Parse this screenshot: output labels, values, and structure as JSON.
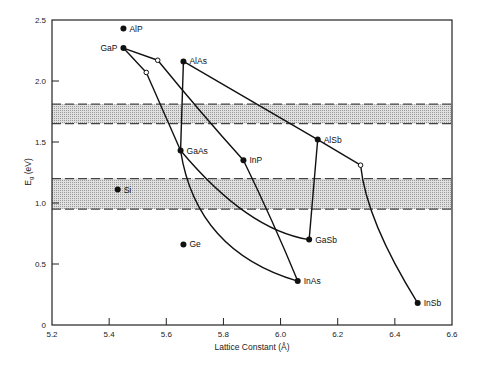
{
  "chart_data": {
    "type": "scatter",
    "title": "",
    "xlabel": "Lattice Constant (Å)",
    "ylabel": "Eg (eV)",
    "ylabel_main": "E",
    "ylabel_sub": "g",
    "ylabel_unit": " (eV)",
    "xlim": [
      5.2,
      6.6
    ],
    "ylim": [
      0,
      2.5
    ],
    "grid": false,
    "legend": null,
    "x_ticks": [
      {
        "value": 5.2,
        "label": "5.2"
      },
      {
        "value": 5.4,
        "label": "5.4"
      },
      {
        "value": 5.6,
        "label": "5.6"
      },
      {
        "value": 5.8,
        "label": "5.8"
      },
      {
        "value": 6.0,
        "label": "6.0"
      },
      {
        "value": 6.2,
        "label": "6.2"
      },
      {
        "value": 6.4,
        "label": "6.4"
      },
      {
        "value": 6.6,
        "label": "6.6"
      }
    ],
    "y_ticks": [
      {
        "value": 0,
        "label": "0"
      },
      {
        "value": 0.5,
        "label": "0.5"
      },
      {
        "value": 1.0,
        "label": "1.0"
      },
      {
        "value": 1.5,
        "label": "1.5"
      },
      {
        "value": 2.0,
        "label": "2.0"
      },
      {
        "value": 2.5,
        "label": "2.5"
      }
    ],
    "bands": [
      {
        "name": "upper-band",
        "y_low": 1.65,
        "y_high": 1.81
      },
      {
        "name": "lower-band",
        "y_low": 0.95,
        "y_high": 1.2
      }
    ],
    "points": [
      {
        "name": "AlP",
        "x": 5.45,
        "y": 2.43
      },
      {
        "name": "GaP",
        "x": 5.45,
        "y": 2.27
      },
      {
        "name": "AlAs",
        "x": 5.66,
        "y": 2.16
      },
      {
        "name": "GaAs",
        "x": 5.65,
        "y": 1.43
      },
      {
        "name": "InP",
        "x": 5.87,
        "y": 1.35
      },
      {
        "name": "AlSb",
        "x": 6.13,
        "y": 1.52
      },
      {
        "name": "GaSb",
        "x": 6.1,
        "y": 0.7
      },
      {
        "name": "InAs",
        "x": 6.06,
        "y": 0.36
      },
      {
        "name": "InSb",
        "x": 6.48,
        "y": 0.18
      },
      {
        "name": "Si",
        "x": 5.43,
        "y": 1.11
      },
      {
        "name": "Ge",
        "x": 5.66,
        "y": 0.66
      }
    ],
    "open_points": [
      {
        "id": "a",
        "x": 5.57,
        "y": 2.17
      },
      {
        "id": "b",
        "x": 5.53,
        "y": 2.07
      },
      {
        "id": "c",
        "x": 6.28,
        "y": 1.31
      }
    ],
    "curves": [
      {
        "from": "GaP",
        "to": "a",
        "via": []
      },
      {
        "from": "GaP",
        "to": "b",
        "via": []
      },
      {
        "from": "a",
        "to": "InP",
        "via": [
          [
            5.72,
            1.75
          ]
        ]
      },
      {
        "from": "b",
        "to": "GaAs",
        "via": [
          [
            5.59,
            1.75
          ]
        ]
      },
      {
        "from": "AlAs",
        "to": "GaAs",
        "via": []
      },
      {
        "from": "AlAs",
        "to": "AlSb",
        "via": []
      },
      {
        "from": "AlSb",
        "to": "c",
        "via": []
      },
      {
        "from": "c",
        "to": "InSb",
        "via": [
          [
            6.34,
            0.8
          ]
        ]
      },
      {
        "from": "AlSb",
        "to": "GaSb",
        "via": []
      },
      {
        "from": "GaAs",
        "to": "GaSb",
        "via": [
          [
            5.88,
            0.92
          ]
        ]
      },
      {
        "from": "GaAs",
        "to": "InAs",
        "via": [
          [
            5.78,
            0.75
          ]
        ]
      },
      {
        "from": "InP",
        "to": "InAs",
        "via": [
          [
            5.97,
            0.85
          ]
        ]
      }
    ]
  },
  "colors": {
    "line": "#111111",
    "band_fill": "#c8c8c8",
    "band_edge": "#444444",
    "axis": "#222222"
  }
}
